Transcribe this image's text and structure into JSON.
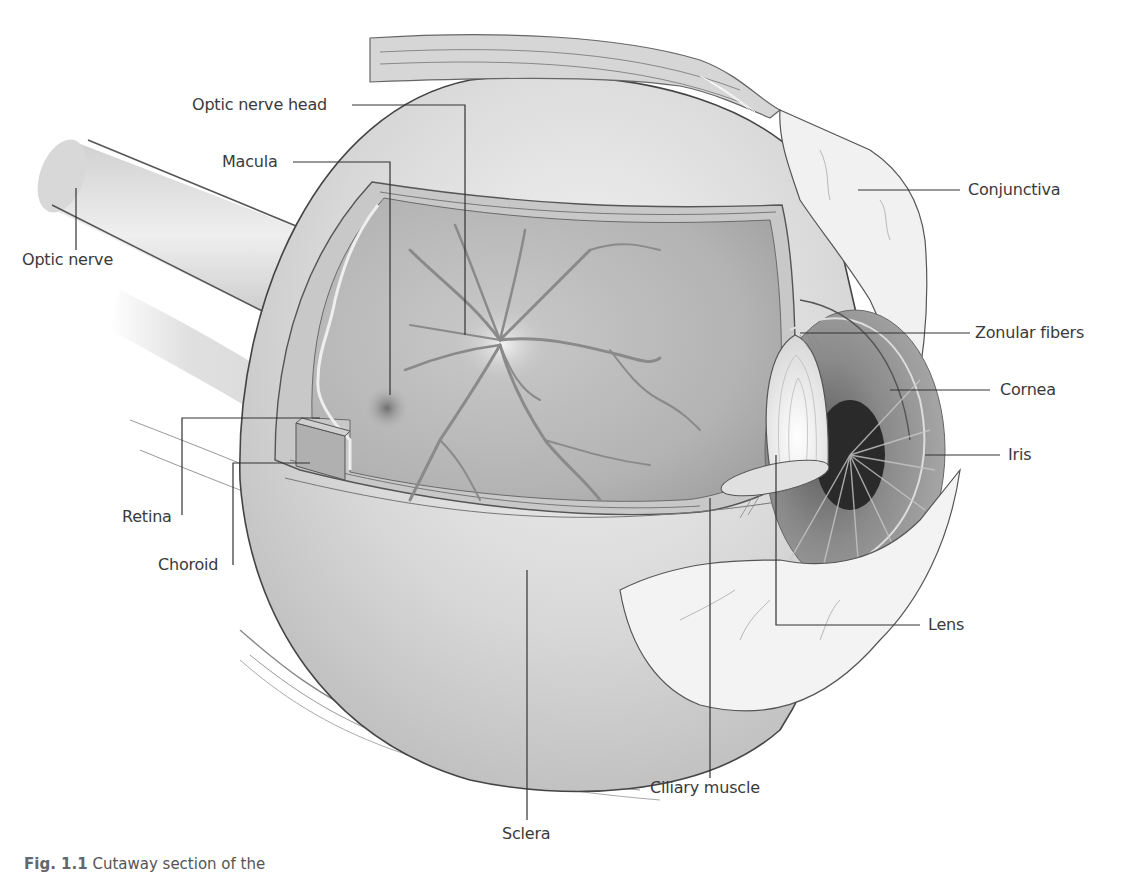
{
  "figure": {
    "caption_number": "Fig. 1.1",
    "caption_text": "Cutaway section of the"
  },
  "labels": {
    "optic_nerve_head": "Optic nerve head",
    "macula": "Macula",
    "optic_nerve": "Optic nerve",
    "conjunctiva": "Conjunctiva",
    "zonular_fibers": "Zonular fibers",
    "cornea": "Cornea",
    "iris": "Iris",
    "lens": "Lens",
    "retina": "Retina",
    "choroid": "Choroid",
    "ciliary_muscle": "Ciliary muscle",
    "sclera": "Sclera"
  },
  "colors": {
    "leader_line": "#333333",
    "label_text": "#3a3a3a",
    "fundus": "#b8b8b8",
    "vessel": "#8a8a8a",
    "globe": "#d9d9d9",
    "iris": "#8c8c8c",
    "pupil": "#2a2a2a"
  }
}
